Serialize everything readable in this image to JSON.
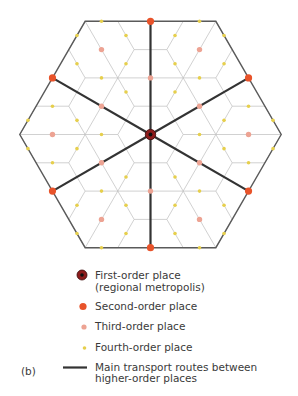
{
  "panel_label": "(b)",
  "colors": {
    "first_order_fill": "#8c1c1c",
    "first_order_core": "#111111",
    "second_order": "#e8532a",
    "third_order": "#eda393",
    "fourth_order": "#e6cf4c",
    "transport_route": "#333333",
    "market_area_grid": "#bdbdbd",
    "region_boundary": "#5a5a5a"
  },
  "places": {
    "first_order_count": 1,
    "second_order_count": 6,
    "third_order_count": 12,
    "main_routes_count": 6
  },
  "legend": {
    "items": [
      {
        "symbol": "first-order",
        "lines": [
          "First-order place",
          "(regional metropolis)"
        ]
      },
      {
        "symbol": "second-order",
        "lines": [
          "Second-order place"
        ]
      },
      {
        "symbol": "third-order",
        "lines": [
          "Third-order place"
        ]
      },
      {
        "symbol": "fourth-order",
        "lines": [
          "Fourth-order place"
        ]
      },
      {
        "symbol": "route",
        "lines": [
          "Main transport routes between",
          "higher-order places"
        ]
      }
    ]
  }
}
